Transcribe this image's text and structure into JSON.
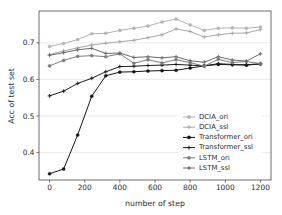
{
  "chart_data": {
    "type": "line",
    "title": "",
    "xlabel": "number of step",
    "ylabel": "Acc of test set",
    "xlim": [
      -60,
      1260
    ],
    "ylim": [
      0.325,
      0.787
    ],
    "xticks": [
      0,
      200,
      400,
      600,
      800,
      1000,
      1200
    ],
    "xticklabels": [
      "0",
      "200",
      "400",
      "600",
      "800",
      "1000",
      "1200"
    ],
    "yticks": [
      0.4,
      0.5,
      0.6,
      0.7
    ],
    "yticklabels": [
      "0.4",
      "0.5",
      "0.6",
      "0.7"
    ],
    "grid": true,
    "grid_axis": "y",
    "legend_position": "lower right",
    "x": [
      0,
      80,
      160,
      240,
      320,
      400,
      480,
      560,
      640,
      720,
      800,
      880,
      960,
      1040,
      1120,
      1200
    ],
    "series": [
      {
        "name": "DCIA_ori",
        "color": "#b3b3b3",
        "marker": "circle",
        "values": [
          0.69,
          0.698,
          0.709,
          0.725,
          0.726,
          0.734,
          0.74,
          0.746,
          0.757,
          0.765,
          0.749,
          0.734,
          0.74,
          0.741,
          0.74,
          0.743
        ]
      },
      {
        "name": "DCIA_ssl",
        "color": "#a8a8a8",
        "marker": "plus",
        "values": [
          0.668,
          0.678,
          0.686,
          0.694,
          0.699,
          0.703,
          0.707,
          0.714,
          0.722,
          0.738,
          0.731,
          0.716,
          0.722,
          0.726,
          0.727,
          0.736
        ]
      },
      {
        "name": "Transformer_ori",
        "color": "#141414",
        "marker": "circle",
        "values": [
          0.342,
          0.355,
          0.448,
          0.554,
          0.61,
          0.62,
          0.621,
          0.623,
          0.624,
          0.625,
          0.631,
          0.637,
          0.641,
          0.64,
          0.639,
          0.642
        ]
      },
      {
        "name": "Transformer_ssl",
        "color": "#1c1c1c",
        "marker": "plus",
        "values": [
          0.555,
          0.568,
          0.589,
          0.603,
          0.621,
          0.635,
          0.636,
          0.638,
          0.639,
          0.641,
          0.639,
          0.637,
          0.643,
          0.641,
          0.64,
          0.643
        ]
      },
      {
        "name": "LSTM_ori",
        "color": "#7d7d7d",
        "marker": "circle",
        "values": [
          0.637,
          0.652,
          0.663,
          0.665,
          0.662,
          0.67,
          0.644,
          0.654,
          0.645,
          0.654,
          0.646,
          0.636,
          0.655,
          0.646,
          0.649,
          0.643
        ]
      },
      {
        "name": "LSTM_ssl",
        "color": "#6b6b6b",
        "marker": "plus",
        "values": [
          0.666,
          0.673,
          0.681,
          0.685,
          0.671,
          0.672,
          0.66,
          0.662,
          0.659,
          0.662,
          0.651,
          0.647,
          0.662,
          0.653,
          0.65,
          0.67
        ]
      }
    ]
  },
  "legend": {
    "entries": [
      {
        "label": "DCIA_ori"
      },
      {
        "label": "DCIA_ssl"
      },
      {
        "label": "Transformer_ori"
      },
      {
        "label": "Transformer_ssl"
      },
      {
        "label": "LSTM_ori"
      },
      {
        "label": "LSTM_ssl"
      }
    ]
  }
}
